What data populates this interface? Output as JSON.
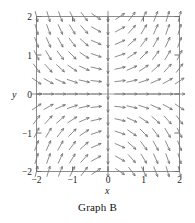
{
  "caption": "Graph B",
  "axes": {
    "xlabel": "x",
    "ylabel": "y",
    "frame_color": "#8a8a8a",
    "axis_color": "#9a9a9a",
    "arrow_color": "#6f6f6f"
  },
  "ticks": {
    "x": [
      "−2",
      "−1",
      "0",
      "1",
      "2"
    ],
    "y": [
      "2",
      "1",
      "0",
      "−1",
      "−2"
    ]
  },
  "chart_data": {
    "type": "scatter",
    "title": "Graph B",
    "subtitle": "",
    "xlabel": "x",
    "ylabel": "y",
    "xlim": [
      -2,
      2
    ],
    "ylim": [
      -2,
      2
    ],
    "xticks": [
      -2,
      -1,
      0,
      1,
      2
    ],
    "yticks": [
      -2,
      -1,
      0,
      1,
      2
    ],
    "grid": false,
    "legend": "none",
    "plot_kind": "direction-field",
    "grid_nx": 13,
    "grid_ny": 13,
    "arrow_length_px": 11,
    "slope_formula": "dy/dx = x * y",
    "sample_points": [
      {
        "x": -2,
        "y": 2,
        "angle_deg": -45
      },
      {
        "x": -1,
        "y": 2,
        "angle_deg": -38
      },
      {
        "x": 0,
        "y": 2,
        "angle_deg": -90
      },
      {
        "x": 1,
        "y": 2,
        "angle_deg": 38
      },
      {
        "x": 2,
        "y": 2,
        "angle_deg": 2
      },
      {
        "x": -2,
        "y": 1,
        "angle_deg": -55
      },
      {
        "x": 0,
        "y": 1,
        "angle_deg": -90
      },
      {
        "x": 2,
        "y": 1,
        "angle_deg": 20
      },
      {
        "x": -2,
        "y": 0,
        "angle_deg": -90
      },
      {
        "x": 0,
        "y": 0,
        "angle_deg": -90
      },
      {
        "x": 2,
        "y": 0,
        "angle_deg": 90
      },
      {
        "x": -2,
        "y": -1,
        "angle_deg": -55
      },
      {
        "x": 0,
        "y": -1,
        "angle_deg": -90
      },
      {
        "x": 2,
        "y": -1,
        "angle_deg": 20
      },
      {
        "x": -2,
        "y": -2,
        "angle_deg": -45
      },
      {
        "x": -1,
        "y": -2,
        "angle_deg": -38
      },
      {
        "x": 0,
        "y": -2,
        "angle_deg": -90
      },
      {
        "x": 1,
        "y": -2,
        "angle_deg": 38
      },
      {
        "x": 2,
        "y": -2,
        "angle_deg": 2
      }
    ]
  }
}
